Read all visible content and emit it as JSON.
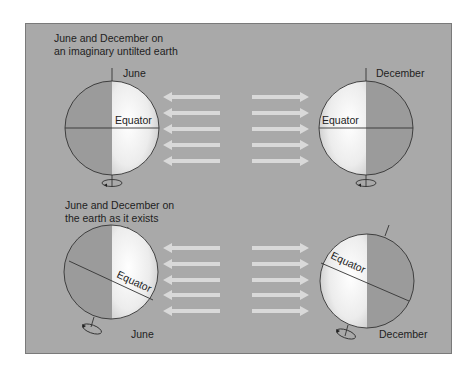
{
  "colors": {
    "background": "#a9a9a9",
    "night_side": "#9a9a9a",
    "day_side_light": "#ffffff",
    "day_side_edge": "#c8c8c8",
    "arrow": "#d9d9d9",
    "outline": "#333333"
  },
  "top_section": {
    "caption_line1": "June and December on",
    "caption_line2": "an imaginary untilted earth",
    "left_globe": {
      "month": "June",
      "equator_label": "Equator",
      "tilt_deg": 0,
      "lit_side": "right"
    },
    "right_globe": {
      "month": "December",
      "equator_label": "Equator",
      "tilt_deg": 0,
      "lit_side": "left"
    },
    "arrows_left": {
      "count": 5,
      "direction": "left"
    },
    "arrows_right": {
      "count": 5,
      "direction": "right"
    }
  },
  "bottom_section": {
    "caption_line1": "June and December on",
    "caption_line2": "the earth as it exists",
    "left_globe": {
      "month": "June",
      "equator_label": "Equator",
      "tilt_deg": 23.5,
      "lit_side": "right"
    },
    "right_globe": {
      "month": "December",
      "equator_label": "Equator",
      "tilt_deg": 23.5,
      "lit_side": "left"
    },
    "arrows_left": {
      "count": 5,
      "direction": "left"
    },
    "arrows_right": {
      "count": 5,
      "direction": "right"
    }
  }
}
